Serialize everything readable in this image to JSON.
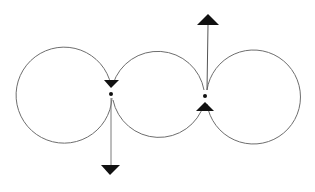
{
  "diagram": {
    "colors": {
      "background": "#ffffff",
      "circle_stroke": "#6e6e6e",
      "arrow": "#111111"
    },
    "circles": [
      {
        "id": "left",
        "cx": 65,
        "cy": 91,
        "r": 48
      },
      {
        "id": "middle",
        "cx": 159,
        "cy": 96,
        "r": 47
      },
      {
        "id": "right",
        "cx": 252,
        "cy": 100,
        "r": 47
      }
    ],
    "junctions": [
      {
        "id": "left-junction",
        "point": [
          112,
          93
        ],
        "arrowhead_at_point": "down",
        "vector": {
          "from": [
            111,
            93
          ],
          "to": [
            111,
            166
          ],
          "direction": "down"
        }
      },
      {
        "id": "right-junction",
        "point": [
          205,
          97
        ],
        "arrowhead_at_point": "up",
        "vector": {
          "from": [
            207,
            92
          ],
          "to": [
            207,
            25
          ],
          "direction": "up"
        }
      }
    ]
  }
}
